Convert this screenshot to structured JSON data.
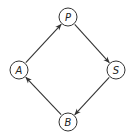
{
  "diagram": {
    "type": "directed-cycle",
    "nodes": [
      {
        "id": "P",
        "label": "P",
        "x": 68,
        "y": 17
      },
      {
        "id": "S",
        "label": "S",
        "x": 116,
        "y": 70
      },
      {
        "id": "B",
        "label": "B",
        "x": 68,
        "y": 122
      },
      {
        "id": "A",
        "label": "A",
        "x": 19,
        "y": 70
      }
    ],
    "edges": [
      {
        "from": "A",
        "to": "P"
      },
      {
        "from": "P",
        "to": "S"
      },
      {
        "from": "S",
        "to": "B"
      },
      {
        "from": "B",
        "to": "A"
      }
    ],
    "colors": {
      "stroke": "#333333",
      "background": "#ffffff"
    }
  }
}
